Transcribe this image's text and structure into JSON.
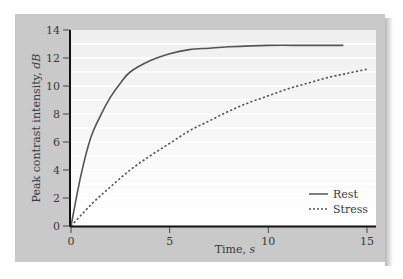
{
  "chart_data": {
    "type": "line",
    "title": "",
    "xlabel": "Time, s",
    "ylabel": "Peak contrast intensity, dB",
    "xlim": [
      0,
      15
    ],
    "ylim": [
      0,
      14
    ],
    "x_ticks": [
      "0",
      "5",
      "10",
      "15"
    ],
    "y_ticks": [
      "0",
      "2",
      "4",
      "6",
      "8",
      "10",
      "12",
      "14"
    ],
    "grid": "horizontal light lines",
    "legend_position": "lower right",
    "series": [
      {
        "name": "Rest",
        "style": "solid",
        "x": [
          0,
          0.5,
          1,
          1.5,
          2,
          2.5,
          3,
          4,
          5,
          6,
          7,
          8,
          10,
          12,
          13.8
        ],
        "values": [
          0,
          3.6,
          6.3,
          7.9,
          9.2,
          10.2,
          11.0,
          11.8,
          12.3,
          12.6,
          12.7,
          12.8,
          12.9,
          12.9,
          12.9
        ]
      },
      {
        "name": "Stress",
        "style": "dotted",
        "x": [
          0,
          1,
          2,
          3,
          4,
          5,
          6,
          7,
          8,
          9,
          10,
          11,
          12,
          13,
          14,
          15
        ],
        "values": [
          0,
          1.5,
          2.8,
          4.0,
          5.0,
          5.9,
          6.8,
          7.5,
          8.2,
          8.8,
          9.3,
          9.8,
          10.2,
          10.6,
          10.9,
          11.2
        ]
      }
    ]
  },
  "axis": {
    "ylabel_main": "Peak contrast intensity, ",
    "ylabel_unit": "dB",
    "xlabel_main": "Time, ",
    "xlabel_unit": "s"
  },
  "legend": {
    "rest": "Rest",
    "stress": "Stress"
  },
  "colors": {
    "frame": "#c9c9c9",
    "plot_bg": "#f4f4f4",
    "line": "#555555"
  }
}
